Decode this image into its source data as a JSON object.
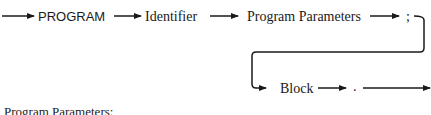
{
  "diagram": {
    "type": "syntax-diagram",
    "nodes": [
      {
        "id": "program",
        "label": "PROGRAM",
        "kind": "terminal-keyword"
      },
      {
        "id": "identifier",
        "label": "Identifier",
        "kind": "nonterminal"
      },
      {
        "id": "params",
        "label": "Program Parameters",
        "kind": "nonterminal"
      },
      {
        "id": "semicolon",
        "label": ";",
        "kind": "terminal-symbol"
      },
      {
        "id": "block",
        "label": "Block",
        "kind": "nonterminal"
      },
      {
        "id": "period",
        "label": ".",
        "kind": "terminal-symbol"
      }
    ],
    "edges": [
      [
        "start",
        "program"
      ],
      [
        "program",
        "identifier"
      ],
      [
        "identifier",
        "params"
      ],
      [
        "params",
        "semicolon"
      ],
      [
        "semicolon",
        "block"
      ],
      [
        "block",
        "period"
      ],
      [
        "period",
        "end"
      ]
    ],
    "caption": "Program Parameters:"
  },
  "colors": {
    "ink": "#1a1a1a",
    "background": "#ffffff"
  }
}
